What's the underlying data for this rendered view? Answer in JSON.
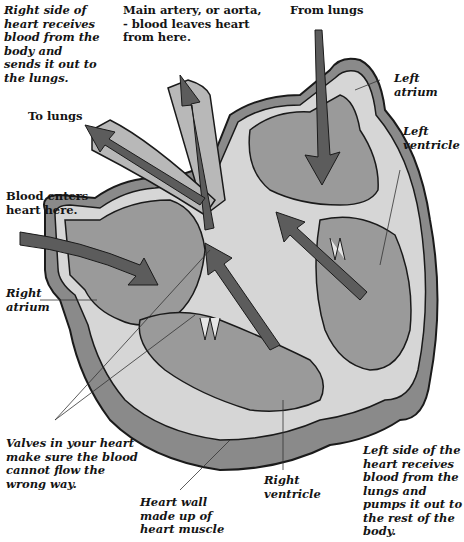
{
  "diagram": {
    "colors": {
      "background": "#ffffff",
      "chamber_fill": "#9a9a9a",
      "wall_fill": "#d6d6d6",
      "outer_wall": "#8a8a8a",
      "arrow_fill": "#5c5c5c",
      "outline": "#1a1a1a"
    },
    "labels": {
      "right_side": "Right side of\nheart receives\nblood from the\nbody and\nsends it out to\nthe lungs.",
      "aorta": "Main artery, or aorta,\n- blood leaves heart\nfrom here.",
      "from_lungs": "From lungs",
      "left_atrium": "Left\natrium",
      "left_ventricle": "Left\nventricle",
      "to_lungs": "To lungs",
      "blood_enters": "Blood enters\nheart here.",
      "right_atrium": "Right\natrium",
      "valves": "Valves in your heart\nmake sure the blood\ncannot flow the\nwrong way.",
      "heart_wall": "Heart wall\nmade up of\nheart muscle",
      "right_ventricle": "Right\nventricle",
      "left_side": "Left side of the\nheart receives\nblood from the\nlungs and\npumps it out to\nthe rest of the\nbody."
    }
  }
}
